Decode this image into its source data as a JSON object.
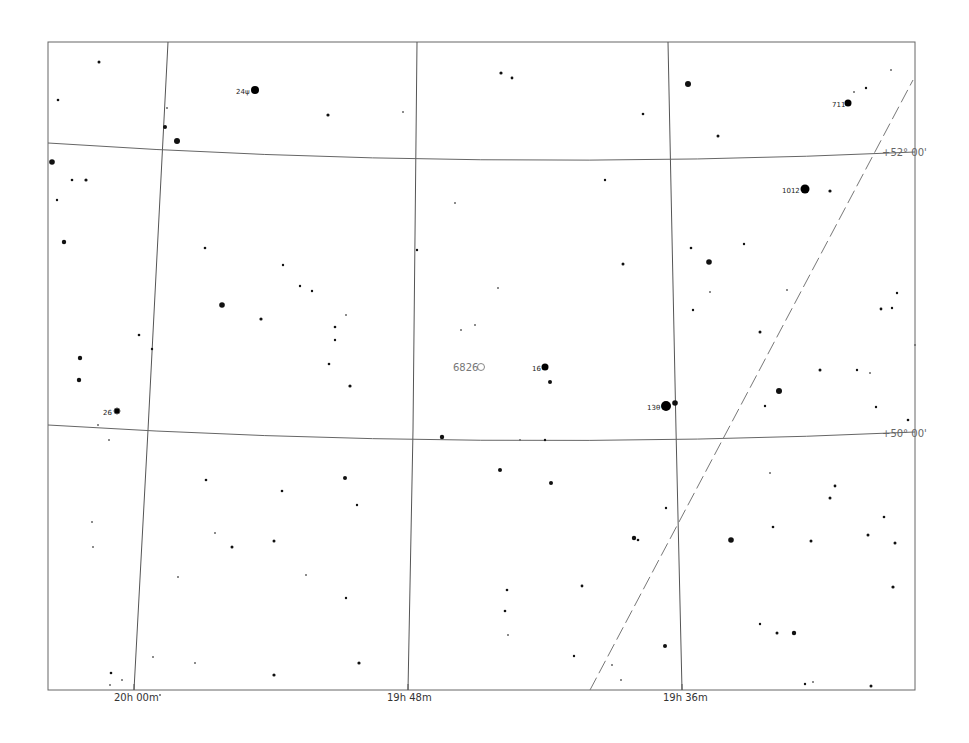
{
  "chart_data": {
    "type": "scatter",
    "title": "",
    "xlabel": "Right Ascension",
    "ylabel": "Declination",
    "ra_ticks": [
      {
        "label": "20h 00m",
        "x": 134
      },
      {
        "label": "19h 48m",
        "x": 408
      },
      {
        "label": "19h 36m",
        "x": 682
      }
    ],
    "dec_lines": [
      {
        "label": "+52° 00'",
        "y_left": 143,
        "y_right": 152
      },
      {
        "label": "+50° 00'",
        "y_left": 425,
        "y_right": 432
      }
    ],
    "grid": true,
    "labeled_stars": [
      {
        "label": "24ψ",
        "x": 255,
        "y": 90,
        "r": 4
      },
      {
        "label": "711",
        "x": 848,
        "y": 103,
        "r": 3.5
      },
      {
        "label": "1012",
        "x": 805,
        "y": 189,
        "r": 4.5
      },
      {
        "label": "16",
        "x": 545,
        "y": 367,
        "r": 3.5
      },
      {
        "label": "13θ",
        "x": 666,
        "y": 406,
        "r": 5
      },
      {
        "label": "26",
        "x": 117,
        "y": 411,
        "r": 3
      }
    ],
    "deep_sky_objects": [
      {
        "label": "6826",
        "x": 481,
        "y": 367,
        "type": "planetary-nebula"
      }
    ],
    "boundary_line": {
      "style": "dashed",
      "from": [
        590,
        690
      ],
      "to": [
        913,
        80
      ]
    }
  },
  "frame": {
    "left": 48,
    "top": 42,
    "right": 915,
    "bottom": 690
  },
  "stars": [
    [
      99,
      62,
      1.5
    ],
    [
      58,
      100,
      1.3
    ],
    [
      64,
      242,
      2.2
    ],
    [
      52,
      162,
      2.8
    ],
    [
      57,
      200,
      1.2
    ],
    [
      72,
      180,
      1.3
    ],
    [
      86,
      180,
      1.6
    ],
    [
      80,
      358,
      2.2
    ],
    [
      79,
      380,
      2.2
    ],
    [
      139,
      335,
      1.3
    ],
    [
      152,
      349,
      1.2
    ],
    [
      165,
      127,
      2
    ],
    [
      177,
      141,
      3
    ],
    [
      167,
      108,
      1
    ],
    [
      205,
      248,
      1.3
    ],
    [
      222,
      305,
      2.8
    ],
    [
      261,
      319,
      1.6
    ],
    [
      328,
      115,
      1.6
    ],
    [
      283,
      265,
      1.2
    ],
    [
      300,
      286,
      1.2
    ],
    [
      312,
      291,
      1.2
    ],
    [
      335,
      327,
      1.3
    ],
    [
      335,
      340,
      1.2
    ],
    [
      329,
      364,
      1.3
    ],
    [
      350,
      386,
      1.6
    ],
    [
      346,
      315,
      1
    ],
    [
      403,
      112,
      1
    ],
    [
      417,
      250,
      1.2
    ],
    [
      455,
      203,
      1
    ],
    [
      442,
      437,
      2.2
    ],
    [
      501,
      73,
      1.6
    ],
    [
      512,
      78,
      1.4
    ],
    [
      605,
      180,
      1.2
    ],
    [
      623,
      264,
      1.5
    ],
    [
      643,
      114,
      1.3
    ],
    [
      498,
      288,
      1
    ],
    [
      475,
      325,
      1
    ],
    [
      461,
      330,
      1
    ],
    [
      550,
      382,
      2
    ],
    [
      545,
      440,
      1.2
    ],
    [
      520,
      440,
      1
    ],
    [
      688,
      84,
      3
    ],
    [
      718,
      136,
      1.5
    ],
    [
      709,
      262,
      2.8
    ],
    [
      691,
      248,
      1.3
    ],
    [
      693,
      310,
      1.2
    ],
    [
      675,
      403,
      2.8
    ],
    [
      710,
      292,
      1
    ],
    [
      744,
      244,
      1.2
    ],
    [
      760,
      332,
      1.5
    ],
    [
      779,
      391,
      3
    ],
    [
      765,
      406,
      1.2
    ],
    [
      787,
      290,
      1
    ],
    [
      830,
      191,
      1.6
    ],
    [
      881,
      309,
      1.4
    ],
    [
      892,
      308,
      1.2
    ],
    [
      897,
      293,
      1.2
    ],
    [
      857,
      370,
      1.2
    ],
    [
      870,
      373,
      1
    ],
    [
      876,
      407,
      1.2
    ],
    [
      908,
      420,
      1.3
    ],
    [
      915,
      345,
      1
    ],
    [
      820,
      370,
      1.5
    ],
    [
      854,
      92,
      1
    ],
    [
      866,
      88,
      1.2
    ],
    [
      891,
      70,
      1
    ],
    [
      206,
      480,
      1.3
    ],
    [
      232,
      547,
      1.5
    ],
    [
      274,
      541,
      1.5
    ],
    [
      282,
      491,
      1.3
    ],
    [
      345,
      478,
      2
    ],
    [
      357,
      505,
      1.2
    ],
    [
      306,
      575,
      1
    ],
    [
      346,
      598,
      1.2
    ],
    [
      359,
      663,
      1.6
    ],
    [
      274,
      675,
      1.6
    ],
    [
      215,
      533,
      1
    ],
    [
      178,
      577,
      1
    ],
    [
      93,
      547,
      1
    ],
    [
      92,
      522,
      1
    ],
    [
      98,
      425,
      1
    ],
    [
      109,
      440,
      1
    ],
    [
      111,
      673,
      1.3
    ],
    [
      110,
      685,
      1
    ],
    [
      122,
      680,
      1
    ],
    [
      153,
      657,
      1
    ],
    [
      160,
      695,
      1
    ],
    [
      195,
      663,
      1
    ],
    [
      500,
      470,
      2
    ],
    [
      551,
      483,
      2
    ],
    [
      582,
      586,
      1.4
    ],
    [
      507,
      590,
      1.3
    ],
    [
      505,
      611,
      1.3
    ],
    [
      508,
      635,
      1
    ],
    [
      574,
      656,
      1.2
    ],
    [
      638,
      540,
      1.3
    ],
    [
      634,
      538,
      2.2
    ],
    [
      665,
      646,
      2
    ],
    [
      666,
      508,
      1.2
    ],
    [
      621,
      680,
      1
    ],
    [
      612,
      665,
      1
    ],
    [
      731,
      540,
      2.8
    ],
    [
      760,
      624,
      1.2
    ],
    [
      777,
      633,
      1.5
    ],
    [
      794,
      633,
      2.2
    ],
    [
      811,
      541,
      1.5
    ],
    [
      830,
      498,
      1.5
    ],
    [
      868,
      535,
      1.5
    ],
    [
      884,
      517,
      1.3
    ],
    [
      895,
      543,
      1.5
    ],
    [
      893,
      587,
      1.6
    ],
    [
      871,
      686,
      1.5
    ],
    [
      805,
      684,
      1.2
    ],
    [
      813,
      682,
      1
    ],
    [
      773,
      527,
      1.3
    ],
    [
      835,
      486,
      1.4
    ],
    [
      770,
      473,
      1
    ]
  ]
}
